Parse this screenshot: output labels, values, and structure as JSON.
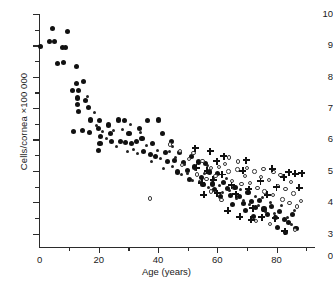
{
  "chart_data": {
    "type": "scatter",
    "title": "",
    "xlabel": "Age (years)",
    "ylabel": "Cells/cornea ×100 000",
    "xlim": [
      0,
      92
    ],
    "ylim": [
      2.55,
      10.1
    ],
    "grid": false,
    "legend": "none",
    "yaxis_break_below": 3,
    "xticks_major": [
      0,
      20,
      40,
      60,
      80
    ],
    "xticks_minor": [
      10,
      30,
      50,
      70,
      90
    ],
    "xtick_labels": [
      "0",
      "20",
      "40",
      "60",
      "80"
    ],
    "yticks_major": [
      3,
      4,
      5,
      6,
      7,
      8,
      9,
      10
    ],
    "yticks_minor": [
      3.5,
      4.5,
      5.5,
      6.5,
      7.5,
      8.5,
      9.5
    ],
    "ytick_labels": [
      "3",
      "4",
      "5",
      "6",
      "7",
      "8",
      "9",
      "10"
    ],
    "yaxis_origin_label": "0",
    "marker_styles": {
      "filled": "large filled circle",
      "dot": "small filled dot",
      "open": "small open circle",
      "plus": "bold plus / cross"
    },
    "series": [
      {
        "name": "filled-circles",
        "marker": "filled",
        "points": [
          [
            0.4,
            8.95
          ],
          [
            4.5,
            9.55
          ],
          [
            3.3,
            9.12
          ],
          [
            5.0,
            9.12
          ],
          [
            9.5,
            9.45
          ],
          [
            7.7,
            8.92
          ],
          [
            8.6,
            8.92
          ],
          [
            8.2,
            8.45
          ],
          [
            5.9,
            8.42
          ],
          [
            12.6,
            8.32
          ],
          [
            12.4,
            7.78
          ],
          [
            11.2,
            7.55
          ],
          [
            13.2,
            7.56
          ],
          [
            12.8,
            7.32
          ],
          [
            12.9,
            7.1
          ],
          [
            13.1,
            6.9
          ],
          [
            14.8,
            7.86
          ],
          [
            15.4,
            7.25
          ],
          [
            16.6,
            7.02
          ],
          [
            17.2,
            6.62
          ],
          [
            14.4,
            6.28
          ],
          [
            11.6,
            6.26
          ],
          [
            17.0,
            6.22
          ],
          [
            20.2,
            6.6
          ],
          [
            20.0,
            6.34
          ],
          [
            20.6,
            6.1
          ],
          [
            20.4,
            5.88
          ],
          [
            19.9,
            5.66
          ],
          [
            23.4,
            6.46
          ],
          [
            23.8,
            6.2
          ],
          [
            26.6,
            6.62
          ],
          [
            28.6,
            6.6
          ],
          [
            30.2,
            6.18
          ],
          [
            24.4,
            5.94
          ],
          [
            27.3,
            5.92
          ],
          [
            29.1,
            5.9
          ],
          [
            31.0,
            5.86
          ],
          [
            32.6,
            5.92
          ],
          [
            33.6,
            6.36
          ],
          [
            36.3,
            6.6
          ],
          [
            40.3,
            6.62
          ],
          [
            34.6,
            6.02
          ],
          [
            38.0,
            5.88
          ],
          [
            41.6,
            6.2
          ],
          [
            35.2,
            5.62
          ],
          [
            37.4,
            5.52
          ],
          [
            39.2,
            5.46
          ],
          [
            42.5,
            5.58
          ],
          [
            44.4,
            5.94
          ],
          [
            43.2,
            5.3
          ],
          [
            45.6,
            5.32
          ],
          [
            47.2,
            5.58
          ],
          [
            48.6,
            5.26
          ],
          [
            46.5,
            4.96
          ],
          [
            49.8,
            5.0
          ],
          [
            51.3,
            5.46
          ],
          [
            52.4,
            5.12
          ],
          [
            53.8,
            5.28
          ],
          [
            50.6,
            4.72
          ],
          [
            54.6,
            4.8
          ],
          [
            56.0,
            5.22
          ],
          [
            57.3,
            4.96
          ],
          [
            55.2,
            4.56
          ],
          [
            58.4,
            4.58
          ],
          [
            60.2,
            4.92
          ],
          [
            59.0,
            4.4
          ],
          [
            62.0,
            4.62
          ],
          [
            63.4,
            4.44
          ],
          [
            61.1,
            4.18
          ],
          [
            64.6,
            4.22
          ],
          [
            66.0,
            4.48
          ],
          [
            67.4,
            4.18
          ],
          [
            65.2,
            3.92
          ],
          [
            68.8,
            3.96
          ],
          [
            70.4,
            4.3
          ],
          [
            71.6,
            4.02
          ],
          [
            69.6,
            3.72
          ],
          [
            73.0,
            3.82
          ],
          [
            74.4,
            4.06
          ],
          [
            75.8,
            3.78
          ],
          [
            72.2,
            3.54
          ],
          [
            77.0,
            3.6
          ],
          [
            78.4,
            3.86
          ],
          [
            79.8,
            3.52
          ],
          [
            81.0,
            3.7
          ],
          [
            82.6,
            3.44
          ],
          [
            80.2,
            3.18
          ],
          [
            84.0,
            3.34
          ],
          [
            85.4,
            3.6
          ],
          [
            83.2,
            3.02
          ],
          [
            86.6,
            3.16
          ]
        ]
      },
      {
        "name": "small-dots",
        "marker": "dot",
        "points": [
          [
            16.2,
            7.36
          ],
          [
            18.4,
            6.86
          ],
          [
            19.2,
            6.46
          ],
          [
            21.4,
            6.24
          ],
          [
            22.6,
            6.02
          ],
          [
            25.0,
            6.28
          ],
          [
            26.0,
            5.78
          ],
          [
            28.0,
            6.32
          ],
          [
            29.8,
            5.62
          ],
          [
            31.8,
            5.68
          ],
          [
            33.0,
            5.56
          ],
          [
            34.2,
            6.22
          ],
          [
            36.0,
            5.8
          ],
          [
            37.8,
            5.3
          ],
          [
            39.8,
            5.66
          ],
          [
            41.0,
            5.4
          ],
          [
            42.0,
            5.08
          ],
          [
            43.8,
            5.62
          ],
          [
            45.0,
            5.14
          ],
          [
            46.0,
            5.42
          ],
          [
            47.8,
            4.88
          ],
          [
            49.0,
            5.2
          ],
          [
            50.0,
            4.92
          ],
          [
            51.8,
            4.7
          ],
          [
            52.8,
            5.04
          ],
          [
            54.0,
            4.66
          ],
          [
            55.8,
            4.9
          ],
          [
            57.0,
            4.46
          ],
          [
            58.8,
            4.76
          ],
          [
            60.8,
            4.54
          ],
          [
            61.8,
            4.3
          ],
          [
            63.0,
            4.74
          ],
          [
            64.2,
            4.36
          ],
          [
            66.4,
            4.12
          ],
          [
            67.8,
            4.4
          ],
          [
            69.0,
            4.06
          ],
          [
            70.8,
            3.92
          ],
          [
            72.8,
            4.18
          ],
          [
            74.0,
            3.9
          ],
          [
            75.2,
            4.16
          ],
          [
            76.4,
            3.7
          ],
          [
            78.0,
            4.0
          ],
          [
            79.2,
            3.64
          ],
          [
            81.6,
            3.88
          ],
          [
            83.6,
            3.5
          ],
          [
            85.0,
            3.3
          ],
          [
            86.0,
            3.74
          ],
          [
            30.6,
            6.48
          ],
          [
            44.8,
            5.76
          ],
          [
            56.8,
            5.16
          ]
        ]
      },
      {
        "name": "open-circles",
        "marker": "open",
        "points": [
          [
            37.2,
            4.12
          ],
          [
            44.0,
            5.84
          ],
          [
            47.4,
            5.64
          ],
          [
            48.2,
            5.18
          ],
          [
            50.4,
            5.38
          ],
          [
            52.0,
            5.56
          ],
          [
            53.2,
            4.88
          ],
          [
            55.0,
            5.32
          ],
          [
            56.4,
            4.74
          ],
          [
            57.8,
            5.1
          ],
          [
            59.4,
            4.84
          ],
          [
            60.6,
            5.12
          ],
          [
            62.6,
            5.22
          ],
          [
            63.8,
            4.98
          ],
          [
            65.0,
            4.68
          ],
          [
            66.8,
            5.04
          ],
          [
            68.2,
            4.58
          ],
          [
            69.4,
            4.84
          ],
          [
            70.0,
            5.1
          ],
          [
            71.0,
            4.62
          ],
          [
            72.6,
            4.98
          ],
          [
            73.6,
            4.46
          ],
          [
            74.8,
            4.8
          ],
          [
            76.0,
            4.34
          ],
          [
            77.4,
            4.7
          ],
          [
            78.8,
            4.22
          ],
          [
            80.6,
            4.52
          ],
          [
            82.0,
            4.08
          ],
          [
            83.0,
            4.42
          ],
          [
            84.4,
            3.98
          ],
          [
            85.8,
            4.28
          ],
          [
            87.0,
            3.86
          ],
          [
            88.2,
            4.04
          ],
          [
            79.0,
            4.96
          ],
          [
            81.4,
            4.86
          ],
          [
            75.6,
            5.06
          ],
          [
            67.0,
            5.3
          ],
          [
            64.0,
            5.42
          ],
          [
            58.0,
            4.34
          ],
          [
            61.4,
            4.06
          ],
          [
            86.2,
            3.12
          ],
          [
            73.2,
            3.4
          ],
          [
            77.8,
            3.3
          ],
          [
            84.8,
            4.64
          ]
        ]
      },
      {
        "name": "plus-markers",
        "marker": "plus",
        "points": [
          [
            52.6,
            5.72
          ],
          [
            53.0,
            5.1
          ],
          [
            54.8,
            4.62
          ],
          [
            56.6,
            5.0
          ],
          [
            58.6,
            4.72
          ],
          [
            60.0,
            4.28
          ],
          [
            62.2,
            5.46
          ],
          [
            64.8,
            4.54
          ],
          [
            66.2,
            4.26
          ],
          [
            68.6,
            5.0
          ],
          [
            70.6,
            4.42
          ],
          [
            72.0,
            3.8
          ],
          [
            74.6,
            4.66
          ],
          [
            76.8,
            4.24
          ],
          [
            78.6,
            5.06
          ],
          [
            80.0,
            4.48
          ],
          [
            82.4,
            4.8
          ],
          [
            84.2,
            4.96
          ],
          [
            86.4,
            4.9
          ],
          [
            88.6,
            4.92
          ],
          [
            79.6,
            3.48
          ],
          [
            82.8,
            3.08
          ],
          [
            71.4,
            3.44
          ],
          [
            63.6,
            3.72
          ],
          [
            57.6,
            5.62
          ],
          [
            59.8,
            5.3
          ],
          [
            67.6,
            3.54
          ],
          [
            75.0,
            3.52
          ],
          [
            87.6,
            4.46
          ],
          [
            69.8,
            5.34
          ],
          [
            61.6,
            4.88
          ],
          [
            55.4,
            4.24
          ]
        ]
      }
    ]
  }
}
